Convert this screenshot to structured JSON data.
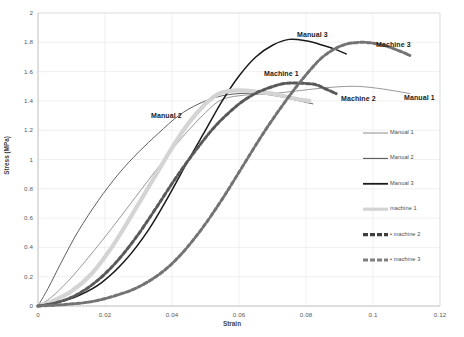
{
  "chart_data": {
    "type": "line",
    "title": "",
    "xlabel": "Strain",
    "ylabel": "Stress (MPa)",
    "xlim": [
      0,
      0.12
    ],
    "ylim": [
      0,
      2
    ],
    "xticks": [
      "0",
      "0.02",
      "0.04",
      "0.06",
      "0.08",
      "0.1",
      "0.12"
    ],
    "xtick_values": [
      0,
      0.02,
      0.04,
      0.06,
      0.08,
      0.1,
      0.12
    ],
    "yticks": [
      "0",
      "0.2",
      "0.4",
      "0.6",
      "0.8",
      "1",
      "1.2",
      "1.4",
      "1.6",
      "1.8",
      "2"
    ],
    "ytick_values": [
      0,
      0.2,
      0.4,
      0.6,
      0.8,
      1.0,
      1.2,
      1.4,
      1.6,
      1.8,
      2.0
    ],
    "grid": true,
    "legend_position": "right",
    "series": [
      {
        "name": "Manual 1",
        "color": "#8c8c8c",
        "width": 0.9,
        "dash": "none",
        "x": [
          0,
          0.004,
          0.009,
          0.015,
          0.022,
          0.029,
          0.036,
          0.043,
          0.05,
          0.055,
          0.062,
          0.07,
          0.078,
          0.086,
          0.094,
          0.1,
          0.106,
          0.111
        ],
        "y": [
          0,
          0.06,
          0.17,
          0.33,
          0.53,
          0.74,
          0.95,
          1.15,
          1.32,
          1.41,
          1.44,
          1.45,
          1.47,
          1.49,
          1.5,
          1.49,
          1.47,
          1.45
        ]
      },
      {
        "name": "Manual 2",
        "color": "#4d4d4d",
        "width": 0.9,
        "dash": "none",
        "x": [
          0,
          0.003,
          0.007,
          0.012,
          0.018,
          0.024,
          0.03,
          0.036,
          0.042,
          0.048,
          0.054,
          0.06,
          0.066,
          0.072,
          0.078,
          0.082
        ],
        "y": [
          0,
          0.12,
          0.3,
          0.51,
          0.72,
          0.9,
          1.05,
          1.18,
          1.3,
          1.38,
          1.43,
          1.45,
          1.45,
          1.43,
          1.4,
          1.38
        ]
      },
      {
        "name": "Manual 3",
        "color": "#1a1a1a",
        "width": 1.5,
        "dash": "none",
        "x": [
          0,
          0.005,
          0.012,
          0.019,
          0.026,
          0.033,
          0.039,
          0.045,
          0.05,
          0.055,
          0.06,
          0.065,
          0.07,
          0.075,
          0.08,
          0.085,
          0.089,
          0.092
        ],
        "y": [
          0,
          0.02,
          0.07,
          0.16,
          0.31,
          0.52,
          0.75,
          1.0,
          1.2,
          1.4,
          1.57,
          1.7,
          1.78,
          1.82,
          1.81,
          1.78,
          1.75,
          1.72
        ]
      },
      {
        "name": "machine 1",
        "color": "#d4d4d4",
        "width": 4.2,
        "dash": "none",
        "x": [
          0,
          0.004,
          0.01,
          0.016,
          0.022,
          0.028,
          0.034,
          0.04,
          0.045,
          0.05,
          0.054,
          0.058,
          0.062,
          0.066,
          0.07,
          0.074,
          0.078,
          0.081
        ],
        "y": [
          0,
          0.03,
          0.1,
          0.22,
          0.4,
          0.62,
          0.85,
          1.08,
          1.25,
          1.38,
          1.45,
          1.47,
          1.47,
          1.46,
          1.45,
          1.43,
          1.41,
          1.4
        ]
      },
      {
        "name": "machine 2",
        "color": "#595959",
        "width": 3.0,
        "dash": "4,2.4",
        "x": [
          0,
          0.005,
          0.011,
          0.017,
          0.023,
          0.029,
          0.035,
          0.041,
          0.047,
          0.053,
          0.059,
          0.064,
          0.069,
          0.074,
          0.079,
          0.083,
          0.086,
          0.089
        ],
        "y": [
          0,
          0.02,
          0.07,
          0.16,
          0.29,
          0.46,
          0.66,
          0.87,
          1.06,
          1.23,
          1.36,
          1.44,
          1.49,
          1.52,
          1.52,
          1.51,
          1.48,
          1.45
        ]
      },
      {
        "name": "machine 3",
        "color": "#737373",
        "width": 3.0,
        "dash": "4,2.4",
        "x": [
          0,
          0.008,
          0.016,
          0.023,
          0.03,
          0.037,
          0.043,
          0.049,
          0.055,
          0.061,
          0.067,
          0.073,
          0.079,
          0.085,
          0.091,
          0.097,
          0.103,
          0.108,
          0.111
        ],
        "y": [
          0,
          0.01,
          0.03,
          0.07,
          0.13,
          0.23,
          0.36,
          0.53,
          0.73,
          0.95,
          1.17,
          1.37,
          1.55,
          1.7,
          1.78,
          1.8,
          1.78,
          1.74,
          1.71
        ]
      }
    ],
    "annotations": [
      {
        "text": "Manual 2",
        "x": 151,
        "y": 112
      },
      {
        "text": "Manual 3",
        "x": 297,
        "y": 31
      },
      {
        "text": "Machine 1",
        "x": 264,
        "y": 70
      },
      {
        "text": "Machine 3",
        "x": 376,
        "y": 41
      },
      {
        "text": "Machine 2",
        "x": 341,
        "y": 95
      },
      {
        "text": "Manual 1",
        "x": 404,
        "y": 94
      }
    ]
  },
  "legend": {
    "items": [
      {
        "label": "Manual 1",
        "color": "#8c8c8c",
        "width": 1.0,
        "dash": "none",
        "prefix": ""
      },
      {
        "label": "Manual 2",
        "color": "#4d4d4d",
        "width": 1.0,
        "dash": "none",
        "prefix": ""
      },
      {
        "label": "Manual 3",
        "color": "#1a1a1a",
        "width": 1.8,
        "dash": "none",
        "prefix": ""
      },
      {
        "label": "machine 1",
        "color": "#d4d4d4",
        "width": 3.2,
        "dash": "none",
        "prefix": ""
      },
      {
        "label": "machine 2",
        "color": "#3f3f3f",
        "width": 3.2,
        "dash": "5,2",
        "prefix": "• "
      },
      {
        "label": "machine 3",
        "color": "#808080",
        "width": 3.2,
        "dash": "5,2",
        "prefix": "• "
      }
    ]
  },
  "plot_frame": {
    "left": 38,
    "top": 13,
    "right": 440,
    "bottom": 306,
    "border_color": "#d9d9d9",
    "grid_color": "#e9e9e9",
    "axis_color": "#bfbfbf"
  }
}
